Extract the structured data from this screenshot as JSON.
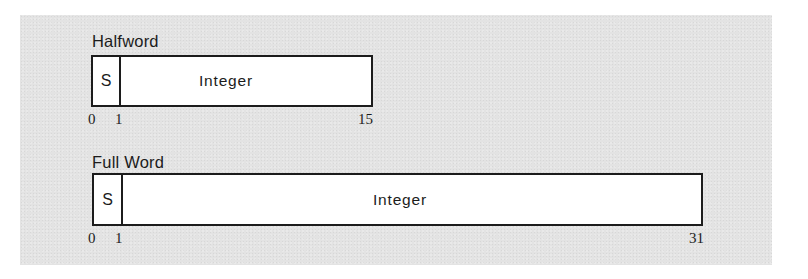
{
  "diagram": {
    "formats": [
      {
        "title": "Halfword",
        "fields": [
          {
            "label": "S",
            "start_bit": 0,
            "end_bit": 0
          },
          {
            "label": "Integer",
            "start_bit": 1,
            "end_bit": 15
          }
        ],
        "bit_labels": [
          "0",
          "1",
          "15"
        ]
      },
      {
        "title": "Full Word",
        "fields": [
          {
            "label": "S",
            "start_bit": 0,
            "end_bit": 0
          },
          {
            "label": "Integer",
            "start_bit": 1,
            "end_bit": 31
          }
        ],
        "bit_labels": [
          "0",
          "1",
          "31"
        ]
      }
    ]
  }
}
